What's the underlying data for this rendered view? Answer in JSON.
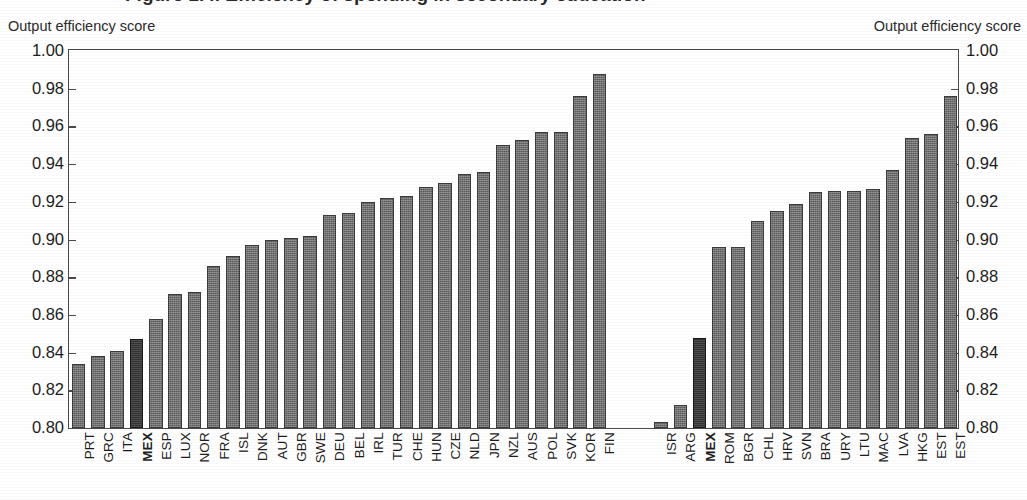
{
  "title": {
    "text": "Figure 1.4. Efficiency of spending in secondary education"
  },
  "axis_caption": {
    "left": "Output efficiency score",
    "right": "Output efficiency score"
  },
  "groups": {
    "oecd": "OECD",
    "non_oecd": "Non-OECD emerging"
  },
  "colors": {
    "bar": "#6e6e6e",
    "bar_highlight": "#3a3a3a",
    "axis": "#4a4a4a",
    "text": "#1d1d1d",
    "background": "#ffffff"
  },
  "chart_data": {
    "type": "bar",
    "title": "Figure 1.4. Efficiency of spending in secondary education",
    "xlabel": "",
    "ylabel": "Output efficiency score",
    "ylim": [
      0.8,
      1.0
    ],
    "ytick_step": 0.02,
    "yticks": [
      "1.00",
      "0.98",
      "0.96",
      "0.94",
      "0.92",
      "0.90",
      "0.88",
      "0.86",
      "0.84",
      "0.82",
      "0.80"
    ],
    "grid": false,
    "legend": "none",
    "highlight_category": "MEX",
    "panels": [
      {
        "name": "OECD",
        "categories": [
          "PRT",
          "GRC",
          "ITA",
          "MEX",
          "ESP",
          "LUX",
          "NOR",
          "FRA",
          "ISL",
          "DNK",
          "AUT",
          "GBR",
          "SWE",
          "DEU",
          "BEL",
          "IRL",
          "TUR",
          "CHE",
          "HUN",
          "CZE",
          "NLD",
          "JPN",
          "NZL",
          "AUS",
          "POL",
          "SVK",
          "KOR",
          "FIN"
        ],
        "values": [
          0.834,
          0.838,
          0.841,
          0.847,
          0.858,
          0.871,
          0.872,
          0.886,
          0.891,
          0.897,
          0.9,
          0.901,
          0.902,
          0.913,
          0.914,
          0.92,
          0.922,
          0.923,
          0.928,
          0.93,
          0.935,
          0.936,
          0.95,
          0.953,
          0.957,
          0.957,
          0.976,
          0.988
        ]
      },
      {
        "name": "Non-OECD emerging",
        "categories": [
          "ISR",
          "ARG",
          "MEX",
          "ROM",
          "BGR",
          "CHL",
          "HRV",
          "SVN",
          "BRA",
          "URY",
          "LTU",
          "MAC",
          "LVA",
          "HKG",
          "EST"
        ],
        "values": [
          0.803,
          0.812,
          0.848,
          0.896,
          0.896,
          0.91,
          0.915,
          0.919,
          0.925,
          0.926,
          0.926,
          0.927,
          0.937,
          0.954,
          0.956,
          0.976
        ]
      }
    ]
  }
}
